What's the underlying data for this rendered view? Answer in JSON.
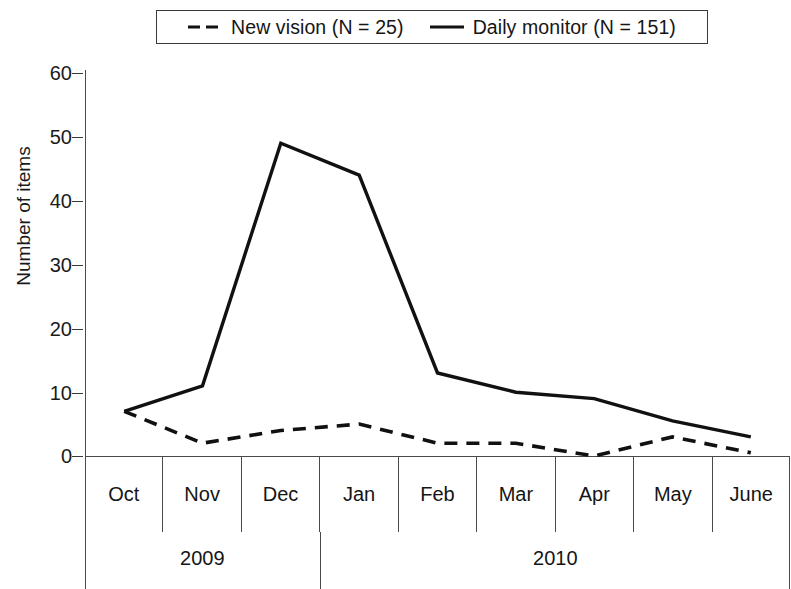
{
  "chart_data": {
    "type": "line",
    "title": "",
    "xlabel": "",
    "ylabel": "Number of items",
    "ylim": [
      0,
      60
    ],
    "yticks": [
      0,
      10,
      20,
      30,
      40,
      50,
      60
    ],
    "grid": false,
    "legend_position": "top-center",
    "categories": [
      "Oct",
      "Nov",
      "Dec",
      "Jan",
      "Feb",
      "Mar",
      "Apr",
      "May",
      "June"
    ],
    "group_labels": [
      {
        "label": "2009",
        "months": [
          "Oct",
          "Nov",
          "Dec"
        ],
        "span": 3
      },
      {
        "label": "2010",
        "months": [
          "Jan",
          "Feb",
          "Mar",
          "Apr",
          "May",
          "June"
        ],
        "span": 6
      }
    ],
    "series": [
      {
        "name": "New vision (N = 25)",
        "style": "dashed",
        "color": "#111111",
        "values": [
          7,
          2,
          4,
          5,
          2,
          2,
          0,
          3,
          0.5
        ]
      },
      {
        "name": "Daily monitor (N = 151)",
        "style": "solid",
        "color": "#111111",
        "values": [
          7,
          11,
          49,
          44,
          13,
          10,
          9,
          5.5,
          3
        ]
      }
    ]
  },
  "legend": {
    "entries": [
      {
        "label": "New vision (N = 25)",
        "style": "dashed"
      },
      {
        "label": "Daily monitor (N = 151)",
        "style": "solid"
      }
    ]
  },
  "yaxis": {
    "title": "Number of items",
    "ticks": [
      "60",
      "50",
      "40",
      "30",
      "20",
      "10",
      "0"
    ]
  },
  "xaxis": {
    "months": [
      "Oct",
      "Nov",
      "Dec",
      "Jan",
      "Feb",
      "Mar",
      "Apr",
      "May",
      "June"
    ],
    "years": [
      "2009",
      "2010"
    ]
  }
}
